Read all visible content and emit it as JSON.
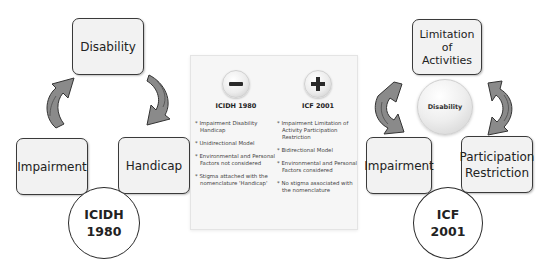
{
  "left_diagram": {
    "top_box": "Disability",
    "bottom_left_box": "Impairment",
    "bottom_right_box": "Handicap",
    "circle_line1": "ICIDH",
    "circle_line2": "1980"
  },
  "comparison_panel": {
    "left": {
      "icon": "minus-icon",
      "title": "ICIDH 1980",
      "points": [
        "* Impairment Disability Handicap",
        "* Unidirectional Model",
        "* Environmental and Personal Factors not considered",
        "* Stigma attached with the nomenclature 'Handicap'"
      ]
    },
    "right": {
      "icon": "plus-icon",
      "title": "ICF 2001",
      "points": [
        "* Impairment Limitation of Activity Participation Restriction",
        "* Bidirectional Model",
        "* Environmental and Personal Factors considered",
        "* No stigma associated with the nomenclature"
      ]
    }
  },
  "right_diagram": {
    "top_box_line1": "Limitation",
    "top_box_line2": "of",
    "top_box_line3": "Activities",
    "center_ball": "Disability",
    "bottom_left_box": "Impairment",
    "bottom_right_box_line1": "Participation",
    "bottom_right_box_line2": "Restriction",
    "circle_line1": "ICF",
    "circle_line2": "2001"
  },
  "colors": {
    "box_fill": "#f2f2f2",
    "box_border": "#3a3a3a",
    "arrow_fill": "#8a8a8a",
    "arrow_dark": "#6e6e6e",
    "panel_bg": "#f6f6f6"
  }
}
